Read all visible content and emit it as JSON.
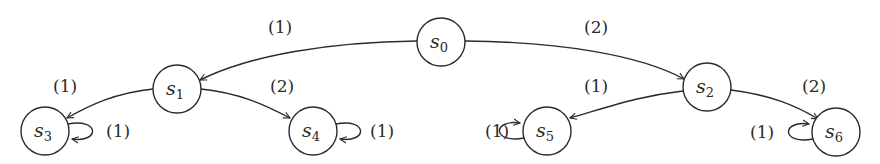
{
  "diagram": {
    "type": "state-transition-tree",
    "colors": {
      "stroke": "#2a2a2a",
      "background": "#ffffff"
    },
    "nodes": [
      {
        "id": "s0",
        "base": "s",
        "sub": "0",
        "x": 441,
        "y": 42
      },
      {
        "id": "s1",
        "base": "s",
        "sub": "1",
        "x": 177,
        "y": 89
      },
      {
        "id": "s2",
        "base": "s",
        "sub": "2",
        "x": 707,
        "y": 87
      },
      {
        "id": "s3",
        "base": "s",
        "sub": "3",
        "x": 45,
        "y": 131
      },
      {
        "id": "s4",
        "base": "s",
        "sub": "4",
        "x": 313,
        "y": 131
      },
      {
        "id": "s5",
        "base": "s",
        "sub": "5",
        "x": 547,
        "y": 131
      },
      {
        "id": "s6",
        "base": "s",
        "sub": "6",
        "x": 836,
        "y": 132
      }
    ],
    "edges": [
      {
        "from": "s0",
        "to": "s1",
        "label": "(1)"
      },
      {
        "from": "s0",
        "to": "s2",
        "label": "(2)"
      },
      {
        "from": "s1",
        "to": "s3",
        "label": "(1)"
      },
      {
        "from": "s1",
        "to": "s4",
        "label": "(2)"
      },
      {
        "from": "s2",
        "to": "s5",
        "label": "(1)"
      },
      {
        "from": "s2",
        "to": "s6",
        "label": "(2)"
      },
      {
        "from": "s3",
        "to": "s3",
        "label": "(1)"
      },
      {
        "from": "s4",
        "to": "s4",
        "label": "(1)"
      },
      {
        "from": "s5",
        "to": "s5",
        "label": "(1)"
      },
      {
        "from": "s6",
        "to": "s6",
        "label": "(1)"
      }
    ]
  }
}
